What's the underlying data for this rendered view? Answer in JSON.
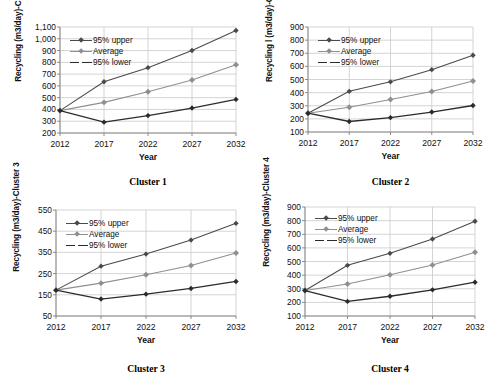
{
  "figure": {
    "panel_count": 4,
    "series_names": [
      "95% upper",
      "Average",
      "95% lower"
    ],
    "colors": {
      "upper": "#4a4a4a",
      "average": "#8f8f8f",
      "lower": "#2b2b2b",
      "grid": "#c9c9c9",
      "axis": "#808080",
      "text": "#111111"
    }
  },
  "chart_data": [
    {
      "type": "line",
      "title": "Cluster 1",
      "caption": "Cluster 1",
      "xlabel": "Year",
      "ylabel": "Recycling  (m3/day)-Cluster 1",
      "x": [
        "2012",
        "2017",
        "2022",
        "2027",
        "2032"
      ],
      "categories": [
        "2012",
        "2017",
        "2022",
        "2027",
        "2032"
      ],
      "ylim": [
        200,
        1100
      ],
      "yticks": [
        200,
        300,
        400,
        500,
        600,
        700,
        800,
        900,
        1000,
        1100
      ],
      "ytick_labels": [
        "200",
        "300",
        "400",
        "500",
        "600",
        "700",
        "800",
        "900",
        "1,000",
        "1,100"
      ],
      "grid": true,
      "legend_position": "top-left-inside",
      "series": [
        {
          "name": "95% upper",
          "values": [
            390,
            635,
            755,
            900,
            1070
          ]
        },
        {
          "name": "Average",
          "values": [
            390,
            460,
            550,
            650,
            780
          ]
        },
        {
          "name": "95% lower",
          "values": [
            390,
            292,
            348,
            412,
            485
          ]
        }
      ]
    },
    {
      "type": "line",
      "title": "Cluster 2",
      "caption": "Cluster 2",
      "xlabel": "Year",
      "ylabel": "Recycling l (m3/day)-Cluster 2",
      "x": [
        "2012",
        "2017",
        "2022",
        "2027",
        "2032"
      ],
      "categories": [
        "2012",
        "2017",
        "2022",
        "2027",
        "2032"
      ],
      "ylim": [
        100,
        900
      ],
      "yticks": [
        100,
        200,
        300,
        400,
        500,
        600,
        700,
        800,
        900
      ],
      "ytick_labels": [
        "100",
        "200",
        "300",
        "400",
        "500",
        "600",
        "700",
        "800",
        "900"
      ],
      "grid": true,
      "legend_position": "top-left-inside",
      "series": [
        {
          "name": "95% upper",
          "values": [
            243,
            410,
            482,
            575,
            685
          ]
        },
        {
          "name": "Average",
          "values": [
            243,
            288,
            348,
            408,
            488
          ]
        },
        {
          "name": "95% lower",
          "values": [
            243,
            180,
            210,
            252,
            302
          ]
        }
      ]
    },
    {
      "type": "line",
      "title": "Cluster 3",
      "caption": "Cluster 3",
      "xlabel": "Year",
      "ylabel": "Recycling  (m3/day)-Cluster 3",
      "x": [
        "2012",
        "2017",
        "2022",
        "2027",
        "2032"
      ],
      "categories": [
        "2012",
        "2017",
        "2022",
        "2027",
        "2032"
      ],
      "ylim": [
        50,
        550
      ],
      "yticks": [
        50,
        150,
        250,
        350,
        450,
        550
      ],
      "ytick_labels": [
        "50",
        "150",
        "250",
        "350",
        "450",
        "550"
      ],
      "grid": true,
      "legend_position": "top-left-inside",
      "series": [
        {
          "name": "95% upper",
          "values": [
            172,
            285,
            342,
            408,
            487
          ]
        },
        {
          "name": "Average",
          "values": [
            172,
            205,
            245,
            288,
            347
          ]
        },
        {
          "name": "95% lower",
          "values": [
            172,
            130,
            153,
            180,
            213
          ]
        }
      ]
    },
    {
      "type": "line",
      "title": "Cluster 4",
      "caption": "Cluster 4",
      "xlabel": "Year",
      "ylabel": "Recycling (m3/day)-Cluster 4",
      "x": [
        "2012",
        "2017",
        "2022",
        "2027",
        "2032"
      ],
      "categories": [
        "2012",
        "2017",
        "2022",
        "2027",
        "2032"
      ],
      "ylim": [
        100,
        900
      ],
      "yticks": [
        100,
        200,
        300,
        400,
        500,
        600,
        700,
        800,
        900
      ],
      "ytick_labels": [
        "100",
        "200",
        "300",
        "400",
        "500",
        "600",
        "700",
        "800",
        "900"
      ],
      "grid": true,
      "legend_position": "top-left-inside",
      "series": [
        {
          "name": "95% upper",
          "values": [
            287,
            472,
            560,
            665,
            795
          ]
        },
        {
          "name": "Average",
          "values": [
            287,
            335,
            402,
            475,
            568
          ]
        },
        {
          "name": "95% lower",
          "values": [
            287,
            207,
            245,
            292,
            348
          ]
        }
      ]
    }
  ]
}
